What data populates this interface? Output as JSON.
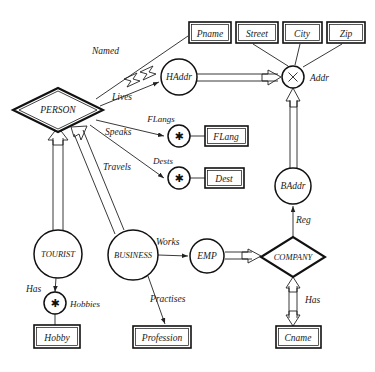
{
  "diagram": {
    "entities": [
      {
        "id": "person",
        "label": "PERSON",
        "shape": "diamond",
        "cx": 58,
        "cy": 110
      },
      {
        "id": "tourist",
        "label": "TOURIST",
        "shape": "circle",
        "cx": 58,
        "cy": 254
      },
      {
        "id": "business",
        "label": "BUSINESS",
        "shape": "circle",
        "cx": 133,
        "cy": 255
      },
      {
        "id": "emp",
        "label": "EMP",
        "shape": "circle",
        "cx": 207,
        "cy": 256
      },
      {
        "id": "company",
        "label": "COMPANY",
        "shape": "diamond",
        "cx": 293,
        "cy": 257
      },
      {
        "id": "haddr",
        "label": "HAddr",
        "shape": "circle",
        "cx": 179,
        "cy": 77
      },
      {
        "id": "baddr",
        "label": "BAddr",
        "shape": "circle",
        "cx": 293,
        "cy": 186
      },
      {
        "id": "addr",
        "label": "Addr",
        "shape": "circle-x",
        "cx": 293,
        "cy": 77
      },
      {
        "id": "flangs",
        "label": "FLangs",
        "shape": "circle-star",
        "cx": 179,
        "cy": 136
      },
      {
        "id": "dests",
        "label": "Dests",
        "shape": "circle-star",
        "cx": 179,
        "cy": 178
      },
      {
        "id": "hobbies",
        "label": "Hobbies",
        "shape": "circle-star",
        "cx": 55,
        "cy": 303
      }
    ],
    "attributes": [
      {
        "id": "pname",
        "label": "Pname",
        "x": 189,
        "y": 22,
        "w": 42,
        "h": 21
      },
      {
        "id": "street",
        "label": "Street",
        "x": 236,
        "y": 22,
        "w": 42,
        "h": 21
      },
      {
        "id": "city",
        "label": "City",
        "x": 283,
        "y": 22,
        "w": 39,
        "h": 21
      },
      {
        "id": "zip",
        "label": "Zip",
        "x": 327,
        "y": 22,
        "w": 38,
        "h": 21
      },
      {
        "id": "flang",
        "label": "FLang",
        "x": 205,
        "y": 126,
        "w": 43,
        "h": 20
      },
      {
        "id": "dest",
        "label": "Dest",
        "x": 205,
        "y": 168,
        "w": 39,
        "h": 20
      },
      {
        "id": "hobby",
        "label": "Hobby",
        "x": 34,
        "y": 325,
        "w": 46,
        "h": 23
      },
      {
        "id": "profession",
        "label": "Profession",
        "x": 133,
        "y": 326,
        "w": 58,
        "h": 22
      },
      {
        "id": "cname",
        "label": "Cname",
        "x": 276,
        "y": 326,
        "w": 45,
        "h": 22
      }
    ],
    "edge_labels": [
      {
        "id": "named",
        "label": "Named",
        "x": 92,
        "y": 54
      },
      {
        "id": "lives",
        "label": "Lives",
        "x": 112,
        "y": 100
      },
      {
        "id": "speaks",
        "label": "Speaks",
        "x": 108,
        "y": 135
      },
      {
        "id": "travels",
        "label": "Travels",
        "x": 107,
        "y": 170
      },
      {
        "id": "flangs",
        "label": "FLangs",
        "x": 161,
        "y": 120
      },
      {
        "id": "dests",
        "label": "Dests",
        "x": 163,
        "y": 162
      },
      {
        "id": "addr",
        "label": "Addr",
        "x": 310,
        "y": 81
      },
      {
        "id": "works",
        "label": "Works",
        "x": 158,
        "y": 245
      },
      {
        "id": "reg",
        "label": "Reg",
        "x": 298,
        "y": 222
      },
      {
        "id": "has_comp",
        "label": "Has",
        "x": 305,
        "y": 303
      },
      {
        "id": "has_tour",
        "label": "Has",
        "x": 32,
        "y": 292
      },
      {
        "id": "hobbies",
        "label": "Hobbies",
        "x": 70,
        "y": 307
      },
      {
        "id": "practises",
        "label": "Practises",
        "x": 150,
        "y": 301
      }
    ],
    "colors": {
      "background": "#ffffff",
      "stroke": "#111111",
      "line": "#222222",
      "text": "#1a1a1a"
    }
  }
}
